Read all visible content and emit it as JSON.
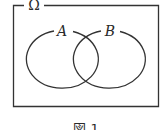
{
  "diagram": {
    "type": "venn",
    "universe_label": "Ω",
    "sets": [
      {
        "label": "A"
      },
      {
        "label": "B"
      }
    ],
    "caption": "図 1",
    "stroke_color": "#333333"
  }
}
